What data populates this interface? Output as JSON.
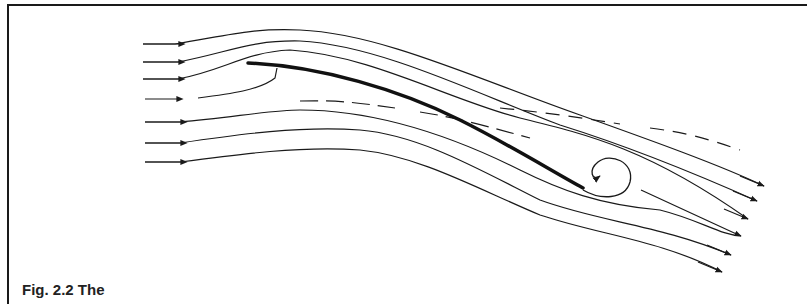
{
  "figure": {
    "caption": "Fig. 2.2 The"
  },
  "diagram": {
    "elements": {
      "plate": "inclined flat plate (thick line)",
      "vortex": "trailing edge spiral vortex",
      "leading_edge_hook": "small leading-edge separation hook",
      "incoming_streamlines": 7,
      "outgoing_streamlines": 6
    },
    "colors": {
      "line": "#1a1a1a",
      "background": "#ffffff"
    }
  }
}
